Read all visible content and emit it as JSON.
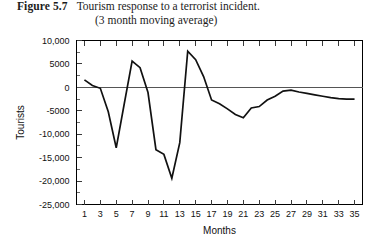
{
  "caption": {
    "figure_label": "Figure 5.7",
    "line1": "Tourism response to a terrorist incident.",
    "line2": "(3 month moving average)"
  },
  "chart_data": {
    "type": "line",
    "title": "Tourism response to a terrorist incident. (3 month moving average)",
    "xlabel": "Months",
    "ylabel": "Tourists",
    "xlim": [
      0,
      36
    ],
    "ylim": [
      -25000,
      10000
    ],
    "grid": false,
    "legend": "none",
    "zero_line": true,
    "x_ticks": [
      1,
      3,
      5,
      7,
      9,
      11,
      13,
      15,
      17,
      19,
      21,
      23,
      25,
      27,
      29,
      31,
      33,
      35
    ],
    "x_tick_labels": [
      "1",
      "3",
      "5",
      "7",
      "9",
      "11",
      "13",
      "15",
      "17",
      "19",
      "21",
      "23",
      "25",
      "27",
      "29",
      "31",
      "33",
      "35"
    ],
    "y_ticks": [
      10000,
      5000,
      0,
      -5000,
      -10000,
      -15000,
      -20000,
      -25000
    ],
    "y_tick_labels": [
      "10,000",
      "5000",
      "0",
      "-5000",
      "-10,000",
      "-15,000",
      "-20,000",
      "-25,000"
    ],
    "series": [
      {
        "name": "Tourists (3 month moving average)",
        "color": "#111111",
        "x": [
          1,
          2,
          3,
          4,
          5,
          6,
          7,
          8,
          9,
          10,
          11,
          12,
          13,
          14,
          15,
          16,
          17,
          18,
          19,
          20,
          21,
          22,
          23,
          24,
          25,
          26,
          27,
          28,
          29,
          30,
          31,
          32,
          33,
          34,
          35
        ],
        "values": [
          1600,
          400,
          -200,
          -5200,
          -12900,
          -3600,
          5600,
          4200,
          -1100,
          -13300,
          -14300,
          -19400,
          -11800,
          7700,
          5900,
          2300,
          -2700,
          -3500,
          -4600,
          -5800,
          -6500,
          -4400,
          -4100,
          -2700,
          -1900,
          -800,
          -600,
          -1000,
          -1300,
          -1600,
          -1900,
          -2200,
          -2400,
          -2500,
          -2500
        ]
      }
    ]
  }
}
